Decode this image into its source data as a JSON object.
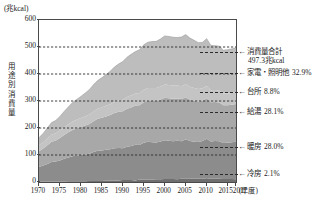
{
  "chart_data": {
    "type": "area",
    "title": "",
    "unit_caption": "(兆kcal)",
    "ylabel": "用途別消費量",
    "xlabel": "(年度)",
    "ylim": [
      0,
      600
    ],
    "yticks": [
      0,
      100,
      200,
      300,
      400,
      500,
      600
    ],
    "xlim": [
      1970,
      2017
    ],
    "xticks": [
      1970,
      1975,
      1980,
      1985,
      1990,
      1995,
      2000,
      2005,
      2010,
      2015,
      2017
    ],
    "grid": "horizontal-dashed",
    "legend_position": "right-callouts",
    "stacked": true,
    "total_label": "消費量合計",
    "total_value": "497.3兆kcal",
    "x": [
      1970,
      1971,
      1972,
      1973,
      1974,
      1975,
      1976,
      1977,
      1978,
      1979,
      1980,
      1981,
      1982,
      1983,
      1984,
      1985,
      1986,
      1987,
      1988,
      1989,
      1990,
      1991,
      1992,
      1993,
      1994,
      1995,
      1996,
      1997,
      1998,
      1999,
      2000,
      2001,
      2002,
      2003,
      2004,
      2005,
      2006,
      2007,
      2008,
      2009,
      2010,
      2011,
      2012,
      2013,
      2014,
      2015,
      2016,
      2017
    ],
    "series": [
      {
        "name": "冷房",
        "share": "2.1%",
        "color": "#6f6f6f",
        "values": [
          1,
          1,
          1,
          2,
          2,
          2,
          2,
          3,
          3,
          3,
          3,
          3,
          4,
          4,
          4,
          4,
          5,
          5,
          5,
          6,
          7,
          7,
          7,
          6,
          9,
          9,
          9,
          9,
          10,
          10,
          11,
          11,
          11,
          10,
          12,
          12,
          12,
          13,
          12,
          12,
          14,
          12,
          12,
          12,
          11,
          11,
          11,
          10
        ]
      },
      {
        "name": "暖房",
        "share": "28.0%",
        "color": "#8c8c8c",
        "values": [
          55,
          60,
          66,
          72,
          74,
          78,
          84,
          88,
          92,
          95,
          97,
          99,
          101,
          107,
          112,
          113,
          114,
          116,
          120,
          120,
          118,
          124,
          126,
          132,
          128,
          136,
          140,
          138,
          136,
          140,
          144,
          142,
          140,
          143,
          139,
          146,
          140,
          136,
          136,
          140,
          146,
          138,
          140,
          139,
          133,
          134,
          136,
          139
        ]
      },
      {
        "name": "給湯",
        "share": "28.1%",
        "color": "#a8a8a8",
        "values": [
          58,
          63,
          69,
          75,
          78,
          83,
          88,
          93,
          98,
          101,
          104,
          107,
          110,
          114,
          118,
          121,
          124,
          127,
          131,
          134,
          137,
          140,
          143,
          145,
          147,
          150,
          152,
          153,
          154,
          156,
          157,
          157,
          157,
          156,
          156,
          156,
          154,
          152,
          150,
          149,
          150,
          145,
          144,
          143,
          140,
          139,
          139,
          140
        ]
      },
      {
        "name": "台所",
        "share": "8.8%",
        "color": "#c4c4c4",
        "values": [
          22,
          23,
          25,
          26,
          27,
          28,
          29,
          30,
          31,
          32,
          33,
          34,
          35,
          36,
          37,
          38,
          39,
          40,
          41,
          42,
          43,
          44,
          45,
          45,
          46,
          47,
          47,
          48,
          48,
          48,
          49,
          49,
          49,
          48,
          48,
          48,
          47,
          47,
          46,
          46,
          46,
          45,
          45,
          45,
          44,
          44,
          44,
          44
        ]
      },
      {
        "name": "家電・照明他",
        "share": "32.9%",
        "color": "#bdbdbd",
        "values": [
          28,
          33,
          39,
          45,
          47,
          52,
          58,
          64,
          70,
          75,
          80,
          86,
          92,
          99,
          105,
          110,
          116,
          122,
          129,
          135,
          141,
          147,
          152,
          155,
          160,
          166,
          170,
          172,
          173,
          176,
          180,
          180,
          179,
          178,
          182,
          184,
          180,
          177,
          172,
          170,
          175,
          166,
          164,
          164,
          160,
          162,
          163,
          164
        ]
      }
    ],
    "callouts": [
      {
        "name": "total",
        "label": "消費量合計",
        "value": "497.3兆kcal",
        "arrow": "←"
      },
      {
        "name": "appliances",
        "label": "家電・照明他",
        "value": "32.9%",
        "arrow": "←"
      },
      {
        "name": "kitchen",
        "label": "台所",
        "value": "8.8%",
        "arrow": "←"
      },
      {
        "name": "hotwater",
        "label": "給湯",
        "value": "28.1%",
        "arrow": "←"
      },
      {
        "name": "heating",
        "label": "暖房",
        "value": "28.0%",
        "arrow": "←"
      },
      {
        "name": "cooling",
        "label": "冷房",
        "value": "2.1%",
        "arrow": "←"
      }
    ]
  }
}
